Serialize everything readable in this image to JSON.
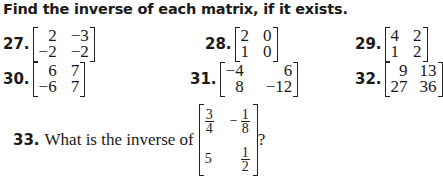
{
  "instructions": "Find the inverse of each matrix, if it exists.",
  "problems": [
    {
      "number": "27.",
      "matrix": [
        [
          "2",
          "−3"
        ],
        [
          "−2",
          "−2"
        ]
      ]
    },
    {
      "number": "28.",
      "matrix": [
        [
          "2",
          "0"
        ],
        [
          "1",
          "0"
        ]
      ]
    },
    {
      "number": "29.",
      "matrix": [
        [
          "4",
          "2"
        ],
        [
          "1",
          "2"
        ]
      ]
    },
    {
      "number": "30.",
      "matrix": [
        [
          "6",
          "7"
        ],
        [
          "−6",
          "7"
        ]
      ]
    },
    {
      "number": "31.",
      "matrix": [
        [
          "−4",
          "6"
        ],
        [
          "8",
          "−12"
        ]
      ]
    },
    {
      "number": "32.",
      "matrix": [
        [
          "9",
          "13"
        ],
        [
          "27",
          "36"
        ]
      ]
    }
  ],
  "problem33": {
    "number": "33.",
    "text": "What is the inverse of",
    "matrix": {
      "a": {
        "num": "3",
        "den": "4"
      },
      "b": {
        "sign": "−",
        "num": "1",
        "den": "8"
      },
      "c": "5",
      "d": {
        "num": "1",
        "den": "2"
      }
    },
    "suffix": "?"
  }
}
